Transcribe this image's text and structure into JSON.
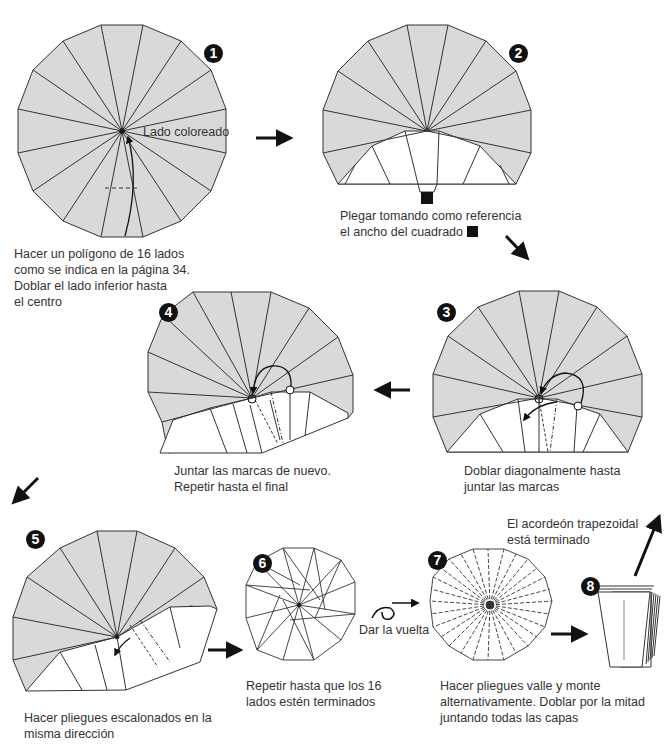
{
  "colors": {
    "colored_side": "#d9d9d9",
    "line": "#333333",
    "white": "#ffffff",
    "badge": "#111111"
  },
  "steps": [
    {
      "number": "1",
      "label": "Lado coloreado",
      "caption": "Hacer un polígono de 16 lados\ncomo se indica en la página 34.\nDoblar el lado inferior hasta\nel centro"
    },
    {
      "number": "2",
      "caption": "Plegar tomando como referencia\nel ancho del cuadrado"
    },
    {
      "number": "3",
      "caption": "Doblar diagonalmente hasta\njuntar las marcas"
    },
    {
      "number": "4",
      "caption": "Juntar las marcas de nuevo.\nRepetir hasta el final"
    },
    {
      "number": "5",
      "caption": "Hacer pliegues escalonados en la\nmisma dirección"
    },
    {
      "number": "6",
      "caption": "Repetir hasta que los 16\nlados estén terminados"
    },
    {
      "number": "7",
      "turn_over_label": "Dar la vuelta",
      "caption": "Hacer pliegues valle y monte\nalternativamente. Doblar por la mitad\njuntando todas las capas"
    },
    {
      "number": "8",
      "caption": "El acordeón trapezoidal\nestá terminado"
    }
  ],
  "icons": {
    "step_arrow": "arrow-icon",
    "reference_square": "square-marker-icon",
    "turn_over": "turn-over-icon"
  }
}
